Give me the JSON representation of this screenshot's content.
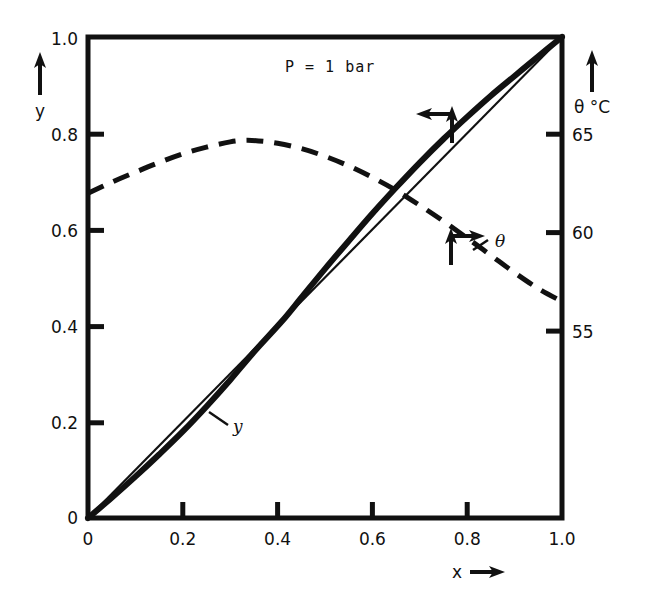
{
  "chart_data": {
    "type": "line",
    "title": "",
    "annotation": "P = 1 bar",
    "xlabel": "x →",
    "xlabel_symbol": "x",
    "ylabel": "y",
    "y2label": "θ °C",
    "xlim": [
      0,
      1
    ],
    "ylim": [
      0,
      1
    ],
    "y2lim": [
      39.31,
      73.79
    ],
    "grid": false,
    "legend": "inline-labels",
    "xticks": [
      0,
      0.2,
      0.4,
      0.6,
      0.8,
      1.0
    ],
    "xticklabels": [
      "0",
      "0.2",
      "0.4",
      "0.6",
      "0.8",
      "1.0"
    ],
    "yticks": [
      0,
      0.2,
      0.4,
      0.6,
      0.8,
      1.0
    ],
    "yticklabels": [
      "0",
      "0.2",
      "0.4",
      "0.6",
      "0.8",
      "1.0"
    ],
    "y2ticks": [
      55,
      60,
      65
    ],
    "y2ticklabels": [
      "55",
      "60",
      "65"
    ],
    "y2tick_positions_frac": [
      0.4501,
      0.5947,
      0.7994
    ],
    "series": [
      {
        "name": "y",
        "label": "y",
        "style": "solid-thick",
        "axis": "left",
        "x": [
          0,
          0.05,
          0.1,
          0.15,
          0.2,
          0.25,
          0.3,
          0.35,
          0.41,
          0.45,
          0.5,
          0.55,
          0.6,
          0.65,
          0.7,
          0.75,
          0.8,
          0.85,
          0.9,
          0.95,
          1.0
        ],
        "values": [
          0,
          0.042,
          0.086,
          0.132,
          0.18,
          0.232,
          0.287,
          0.345,
          0.41,
          0.458,
          0.518,
          0.576,
          0.633,
          0.687,
          0.739,
          0.788,
          0.834,
          0.878,
          0.919,
          0.96,
          1.0
        ]
      },
      {
        "name": "diagonal",
        "label": "",
        "style": "solid-thin",
        "axis": "left",
        "x": [
          0,
          1.0
        ],
        "values": [
          0,
          1.0
        ]
      },
      {
        "name": "theta",
        "label": "θ",
        "style": "dashed",
        "axis": "right",
        "x": [
          0,
          0.05,
          0.1,
          0.15,
          0.2,
          0.25,
          0.3,
          0.33,
          0.36,
          0.4,
          0.45,
          0.5,
          0.55,
          0.6,
          0.65,
          0.7,
          0.75,
          0.8,
          0.85,
          0.9,
          0.95,
          1.0
        ],
        "values": [
          0.675,
          0.698,
          0.719,
          0.739,
          0.757,
          0.771,
          0.782,
          0.785,
          0.784,
          0.779,
          0.768,
          0.752,
          0.732,
          0.708,
          0.681,
          0.65,
          0.617,
          0.582,
          0.546,
          0.51,
          0.477,
          0.45
        ],
        "values_celsius": [
          63.0,
          63.8,
          64.5,
          65.2,
          65.8,
          66.3,
          66.7,
          66.8,
          66.7,
          66.6,
          66.2,
          65.6,
          65.0,
          64.1,
          63.2,
          62.1,
          60.9,
          59.7,
          58.5,
          57.2,
          56.1,
          55.2
        ]
      }
    ],
    "callouts": [
      {
        "name": "y-curve-pointer",
        "target_x": 0.76,
        "target_y": 0.8,
        "label": ""
      },
      {
        "name": "theta-curve-pointer",
        "target_x": 0.7,
        "target_y": 0.6,
        "label": "θ"
      },
      {
        "name": "y-leader-label",
        "target_x": 0.23,
        "target_y": 0.245,
        "label": "y"
      }
    ]
  }
}
